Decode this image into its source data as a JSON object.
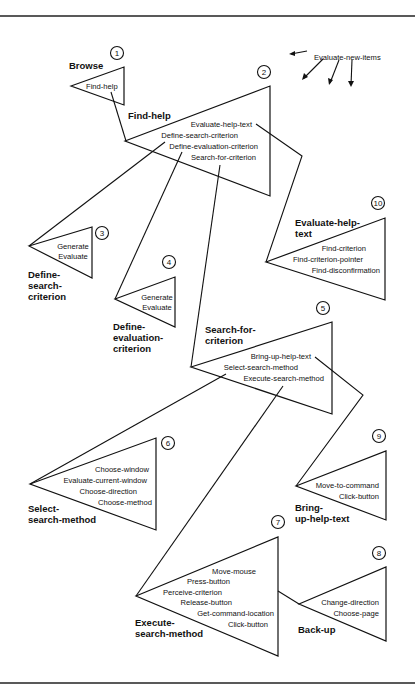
{
  "diagram": {
    "legend": {
      "label": "Evaluate-new-items"
    },
    "nodes": [
      {
        "id": "1",
        "number": "1",
        "title_lines": [
          "Browse"
        ],
        "items": [
          "Find-help"
        ]
      },
      {
        "id": "2",
        "number": "2",
        "title_lines": [
          "Find-help"
        ],
        "items": [
          "Evaluate-help-text",
          "Define-search-criterion",
          "Define-evaluation-criterion",
          "Search-for-criterion"
        ]
      },
      {
        "id": "3",
        "number": "3",
        "title_lines": [
          "Define-",
          "search-",
          "criterion"
        ],
        "items": [
          "Generate",
          "Evaluate"
        ]
      },
      {
        "id": "4",
        "number": "4",
        "title_lines": [
          "Define-",
          "evaluation-",
          "criterion"
        ],
        "items": [
          "Generate",
          "Evaluate"
        ]
      },
      {
        "id": "5",
        "number": "5",
        "title_lines": [
          "Search-for-",
          "criterion"
        ],
        "items": [
          "Bring-up-help-text",
          "Select-search-method",
          "Execute-search-method"
        ]
      },
      {
        "id": "6",
        "number": "6",
        "title_lines": [
          "Select-",
          "search-method"
        ],
        "items": [
          "Choose-window",
          "Evaluate-current-window",
          "Choose-direction",
          "Choose-method"
        ]
      },
      {
        "id": "7",
        "number": "7",
        "title_lines": [
          "Execute-",
          "search-method"
        ],
        "items": [
          "Move-mouse",
          "Press-button",
          "Perceive-criterion",
          "Release-button",
          "Get-command-location",
          "Click-button"
        ]
      },
      {
        "id": "8",
        "number": "8",
        "title_lines": [
          "Back-up"
        ],
        "items": [
          "Change-direction",
          "Choose-page"
        ]
      },
      {
        "id": "9",
        "number": "9",
        "title_lines": [
          "Bring-",
          "up-help-text"
        ],
        "items": [
          "Move-to-command",
          "Click-button"
        ]
      },
      {
        "id": "10",
        "number": "10",
        "title_lines": [
          "Evaluate-help-",
          "text"
        ],
        "items": [
          "Find-criterion",
          "Find-criterion-pointer",
          "Find-disconfirmation"
        ]
      }
    ],
    "colors": {
      "stroke": "#111111",
      "background": "#ffffff"
    }
  }
}
